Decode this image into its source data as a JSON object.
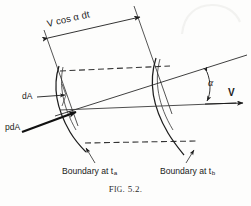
{
  "figure": {
    "caption_prefix": "F",
    "caption_smallcaps": "IG",
    "caption_rest": ". 5.2.",
    "caption_full": "Fig. 5.2."
  },
  "labels": {
    "displacement": "V cos α dt",
    "area_element": "dA",
    "pressure_force": "pdA",
    "angle": "α",
    "velocity": "V",
    "boundary_a_text": "Boundary at t",
    "boundary_a_sub": "a",
    "boundary_b_text": "Boundary at t",
    "boundary_b_sub": "b"
  },
  "colors": {
    "ink": "#1a1a1a",
    "line": "#2a2a2a",
    "dashed": "#3a3a3a",
    "paper": "#fdfdfc",
    "smudge": "#f4f4f2"
  },
  "geometry": {
    "boundary_a_label_target": "left boundary curve at time t_a",
    "boundary_b_label_target": "right boundary curve at time t_b",
    "angle_between": "velocity vector V and normal-to-surface direction",
    "dimension_line": "slant distance between the two boundaries"
  }
}
